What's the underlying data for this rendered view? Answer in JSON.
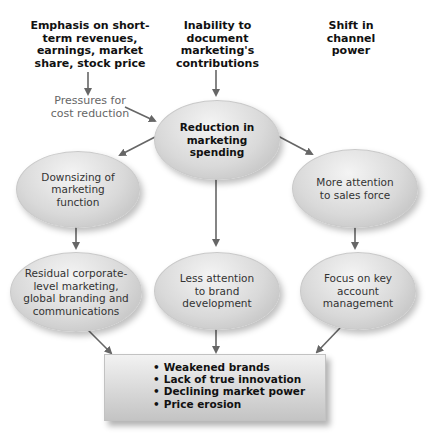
{
  "diagram": {
    "causes": [
      {
        "id": "emphasis",
        "label": "Emphasis on short-term revenues, earnings, market share, stock price",
        "lines": [
          "Emphasis on short-",
          "term revenues,",
          "earnings, market",
          "share, stock price"
        ]
      },
      {
        "id": "inability",
        "label": "Inability to document marketing's contributions",
        "lines": [
          "Inability to",
          "document",
          "marketing's",
          "contributions"
        ]
      },
      {
        "id": "shift",
        "label": "Shift in channel power",
        "lines": [
          "Shift in",
          "channel",
          "power"
        ]
      }
    ],
    "intermediate": {
      "id": "pressures",
      "lines": [
        "Pressures for",
        "cost reduction"
      ]
    },
    "central": {
      "id": "reduction",
      "lines": [
        "Reduction in",
        "marketing",
        "spending"
      ]
    },
    "effects_level1": [
      {
        "id": "downsizing",
        "lines": [
          "Downsizing of",
          "marketing",
          "function"
        ]
      },
      {
        "id": "sales-force",
        "lines": [
          "More attention",
          "to sales force"
        ]
      }
    ],
    "effects_level2": [
      {
        "id": "residual",
        "lines": [
          "Residual corporate-",
          "level marketing,",
          "global branding and",
          "communications"
        ]
      },
      {
        "id": "less-attention",
        "lines": [
          "Less attention",
          "to brand",
          "development"
        ]
      },
      {
        "id": "key-account",
        "lines": [
          "Focus on key",
          "account",
          "management"
        ]
      }
    ],
    "outcomes": [
      "Weakened brands",
      "Lack of true innovation",
      "Declining market power",
      "Price erosion"
    ],
    "edges": [
      [
        "emphasis",
        "pressures"
      ],
      [
        "pressures",
        "reduction"
      ],
      [
        "inability",
        "reduction"
      ],
      [
        "reduction",
        "downsizing"
      ],
      [
        "reduction",
        "less-attention"
      ],
      [
        "reduction",
        "sales-force"
      ],
      [
        "downsizing",
        "residual"
      ],
      [
        "sales-force",
        "key-account"
      ],
      [
        "residual",
        "outcomes"
      ],
      [
        "less-attention",
        "outcomes"
      ],
      [
        "key-account",
        "outcomes"
      ]
    ],
    "colors": {
      "arrow": "#666666",
      "node_fill": "#d9d9d9",
      "text": "#222222",
      "pressure_text": "#666666"
    }
  }
}
